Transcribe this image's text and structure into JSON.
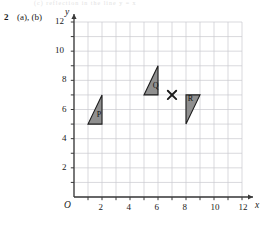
{
  "page": {
    "question_number": "2",
    "question_parts": "(a), (b)",
    "faint_bleedthrough": "(c) reflection in the line y = x"
  },
  "chart_data": {
    "type": "scatter",
    "title": "",
    "xlabel": "x",
    "ylabel": "y",
    "xlim": [
      0,
      12
    ],
    "ylim": [
      0,
      12
    ],
    "grid": true,
    "grid_step": 1,
    "legend": "none",
    "origin_label": "O",
    "x_ticks": [
      2,
      4,
      6,
      8,
      10,
      12
    ],
    "x_tick_labels": [
      "2",
      "4",
      "6",
      "8",
      "10",
      "12"
    ],
    "y_ticks": [
      2,
      4,
      6,
      8,
      10,
      12
    ],
    "y_tick_labels": [
      "2",
      "4",
      "6",
      "8",
      "10",
      "12"
    ],
    "shapes": [
      {
        "name": "P",
        "label": "P",
        "type": "triangle",
        "vertices": [
          [
            1,
            5
          ],
          [
            2,
            5
          ],
          [
            2,
            7
          ]
        ],
        "fill": "#8f8f8f",
        "stroke": "#1d1d1d",
        "label_at": [
          1.62,
          5.35
        ]
      },
      {
        "name": "Q",
        "label": "Q",
        "type": "triangle",
        "vertices": [
          [
            5,
            7
          ],
          [
            6,
            7
          ],
          [
            6,
            9
          ]
        ],
        "fill": "#8f8f8f",
        "stroke": "#1d1d1d",
        "label_at": [
          5.62,
          7.35
        ]
      },
      {
        "name": "R",
        "label": "R",
        "type": "triangle",
        "vertices": [
          [
            8,
            7
          ],
          [
            9,
            7
          ],
          [
            8,
            5
          ]
        ],
        "fill": "#8f8f8f",
        "stroke": "#1d1d1d",
        "label_at": [
          8.12,
          6.42
        ]
      }
    ],
    "markers": [
      {
        "name": "centre-of-rotation",
        "symbol": "x",
        "x": 7,
        "y": 7,
        "color": "#1a1a1a"
      }
    ],
    "colors": {
      "grid_line": "#c9c9cf",
      "axis_line": "#3a3a3a",
      "shape_fill": "#8f8f8f",
      "shape_stroke": "#1d1d1d",
      "text": "#1a1a1a"
    }
  }
}
